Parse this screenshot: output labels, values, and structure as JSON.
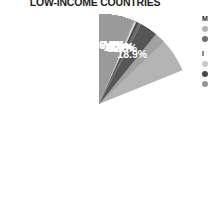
{
  "title": "LOW-INCOME COUNTRIES",
  "chart_data": {
    "type": "pie",
    "title": "LOW-INCOME COUNTRIES",
    "xlabel": "",
    "ylabel": "",
    "legend_position": "right",
    "grid": false,
    "value_suffix": "%",
    "start_angle_deg": 0,
    "direction": "clockwise",
    "categories": [
      "slice-1",
      "slice-2",
      "slice-3",
      "slice-4",
      "slice-5",
      "slice-6",
      "slice-7",
      "slice-8",
      "slice-9",
      "slice-10"
    ],
    "values": [
      18.9,
      12.8,
      11.1,
      10.8,
      10.6,
      7.7,
      7.7,
      7.2,
      6.8,
      6.4
    ],
    "labels": [
      "18.9%",
      "12.8%",
      "11.1%",
      "10.8%",
      "10.6%",
      "7.7%",
      "7.7%",
      "7.2%",
      "6.8%",
      "6.4%"
    ],
    "colors": [
      "#b4b4b4",
      "#a2a2a2",
      "#949494",
      "#4a4a4a",
      "#565656",
      "#c9c9c9",
      "#6e6e6e",
      "#4a4a4a",
      "#d6d6d6",
      "#9a9a9a"
    ],
    "slices": [
      {
        "label": "18.9%",
        "value": 18.9,
        "color": "#b4b4b4"
      },
      {
        "label": "12.8%",
        "value": 12.8,
        "color": "#a2a2a2"
      },
      {
        "label": "11.1%",
        "value": 11.1,
        "color": "#949494"
      },
      {
        "label": "10.8%",
        "value": 10.8,
        "color": "#4a4a4a"
      },
      {
        "label": "10.6%",
        "value": 10.6,
        "color": "#565656"
      },
      {
        "label": "7.7%",
        "value": 7.7,
        "color": "#c9c9c9"
      },
      {
        "label": "7.7%",
        "value": 7.7,
        "color": "#6e6e6e"
      },
      {
        "label": "7.2%",
        "value": 7.2,
        "color": "#4a4a4a"
      },
      {
        "label": "6.8%",
        "value": 6.8,
        "color": "#d6d6d6"
      },
      {
        "label": "6.4%",
        "value": 6.4,
        "color": "#9a9a9a"
      }
    ]
  },
  "legend": {
    "clipped": true,
    "groups": [
      {
        "title": "M",
        "items": [
          {
            "label": "",
            "color": "#b4b4b4"
          },
          {
            "label": "",
            "color": "#6e6e6e"
          }
        ]
      },
      {
        "title": "I",
        "items": [
          {
            "label": "",
            "color": "#c9c9c9"
          },
          {
            "label": "",
            "color": "#4a4a4a"
          },
          {
            "label": "",
            "color": "#949494"
          }
        ]
      }
    ]
  }
}
